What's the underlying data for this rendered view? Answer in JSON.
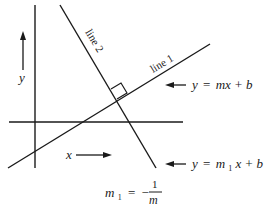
{
  "diagram": {
    "type": "perpendicular-lines",
    "colors": {
      "stroke": "#1a1a1a",
      "background": "#ffffff"
    },
    "axes": {
      "x_label": "x",
      "y_label": "y"
    },
    "lines": [
      {
        "id": "line1",
        "label": "line 1",
        "equation_lhs": "y",
        "equation_eq": "=",
        "equation_rhs": "mx + b"
      },
      {
        "id": "line2",
        "label": "line 2",
        "equation_lhs": "y",
        "equation_eq": "=",
        "equation_m": "m",
        "equation_m_sub": "1",
        "equation_x": "x + b",
        "equation_b_sub": "1"
      }
    ],
    "relation": {
      "lhs": "m",
      "lhs_sub": "1",
      "eq": "=",
      "sign": "−",
      "numerator": "1",
      "denominator": "m"
    },
    "markers": {
      "right_angle": "right-angle-box"
    }
  }
}
